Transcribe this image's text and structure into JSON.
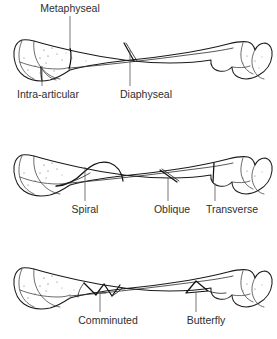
{
  "figure": {
    "background_color": "#ffffff",
    "ink_color": "#1b1b1b",
    "label_color": "#2e2e2e",
    "panel_count": 3
  },
  "panels": [
    {
      "id": "panel-1",
      "name": "fracture-location-panel",
      "bone": "long-bone-femur",
      "labels": [
        {
          "key": "metaphyseal",
          "text": "Metaphyseal",
          "position": "top",
          "leader_from": [
            152,
            16
          ],
          "leader_to": [
            152,
            47
          ],
          "text_anchor": "middle",
          "text_xy": [
            152,
            12
          ]
        },
        {
          "key": "intra_articular",
          "text": "Intra-articular",
          "position": "bottom",
          "leader_from": [
            96,
            87
          ],
          "leader_to": [
            96,
            63
          ],
          "text_anchor": "middle",
          "text_xy": [
            96,
            99
          ]
        },
        {
          "key": "diaphyseal",
          "text": "Diaphyseal",
          "position": "bottom",
          "leader_from": [
            189,
            87
          ],
          "leader_to": [
            189,
            46
          ],
          "text_anchor": "middle",
          "text_xy": [
            189,
            99
          ]
        }
      ]
    },
    {
      "id": "panel-2",
      "name": "fracture-line-pattern-panel",
      "bone": "long-bone-femur",
      "labels": [
        {
          "key": "spiral",
          "text": "Spiral",
          "position": "bottom",
          "leader_from": [
            85,
            202
          ],
          "leader_to": [
            85,
            163
          ],
          "text_anchor": "middle",
          "text_xy": [
            85,
            214
          ]
        },
        {
          "key": "oblique",
          "text": "Oblique",
          "position": "bottom",
          "leader_from": [
            165,
            202
          ],
          "leader_to": [
            165,
            165
          ],
          "text_anchor": "middle",
          "text_xy": [
            165,
            214
          ]
        },
        {
          "key": "transverse",
          "text": "Transverse",
          "position": "bottom",
          "leader_from": [
            219,
            202
          ],
          "leader_to": [
            219,
            166
          ],
          "text_anchor": "middle",
          "text_xy": [
            225,
            214
          ]
        }
      ]
    },
    {
      "id": "panel-3",
      "name": "fracture-fragment-panel",
      "bone": "long-bone-femur",
      "labels": [
        {
          "key": "comminuted",
          "text": "Comminuted",
          "position": "bottom",
          "leader_from": [
            97,
            313
          ],
          "leader_to": [
            97,
            283
          ],
          "text_anchor": "middle",
          "text_xy": [
            97,
            325
          ]
        },
        {
          "key": "butterfly",
          "text": "Butterfly",
          "position": "bottom",
          "leader_from": [
            198,
            313
          ],
          "leader_to": [
            198,
            284
          ],
          "text_anchor": "middle",
          "text_xy": [
            198,
            325
          ]
        }
      ]
    }
  ],
  "fracture_types": [
    "Metaphyseal",
    "Intra-articular",
    "Diaphyseal",
    "Spiral",
    "Oblique",
    "Transverse",
    "Comminuted",
    "Butterfly"
  ]
}
